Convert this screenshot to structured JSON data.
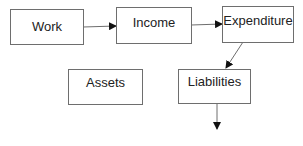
{
  "diagram": {
    "nodes": {
      "work": "Work",
      "income": "Income",
      "expenditure": "Expenditure",
      "assets": "Assets",
      "liabilities": "Liabilities"
    },
    "edges": [
      {
        "from": "work",
        "to": "income"
      },
      {
        "from": "income",
        "to": "expenditure"
      },
      {
        "from": "expenditure",
        "to": "liabilities"
      },
      {
        "from": "liabilities",
        "to": "(unlabeled)"
      }
    ],
    "colors": {
      "stroke": "#6e6e6e",
      "arrowhead": "#111111",
      "text": "#222222"
    }
  }
}
